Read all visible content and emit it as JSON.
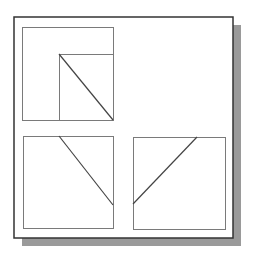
{
  "diagram": {
    "canvas": {
      "width": 254,
      "height": 263,
      "background": "#ffffff"
    },
    "frame": {
      "x": 14,
      "y": 17,
      "width": 219,
      "height": 221,
      "stroke": "#333333",
      "stroke_width": 1.5,
      "shadow": {
        "dx": 8,
        "dy": 8,
        "color": "#9a9a9a"
      }
    },
    "panels": [
      {
        "name": "top-left-panel",
        "box": {
          "x": 22,
          "y": 27,
          "width": 91,
          "height": 93
        },
        "sub_box": {
          "x": 59,
          "y": 54,
          "width": 54,
          "height": 66
        },
        "diagonal": {
          "x1": 59,
          "y1": 54,
          "x2": 113,
          "y2": 120
        }
      },
      {
        "name": "bottom-left-panel",
        "box": {
          "x": 23,
          "y": 136,
          "width": 90,
          "height": 92
        },
        "diagonal": {
          "x1": 59,
          "y1": 136,
          "x2": 113,
          "y2": 205
        }
      },
      {
        "name": "bottom-right-panel",
        "box": {
          "x": 133,
          "y": 137,
          "width": 92,
          "height": 92
        },
        "diagonal": {
          "x1": 197,
          "y1": 137,
          "x2": 133,
          "y2": 204
        }
      }
    ],
    "colors": {
      "box_stroke": "#7a7a7a",
      "line_stroke": "#444444"
    }
  }
}
